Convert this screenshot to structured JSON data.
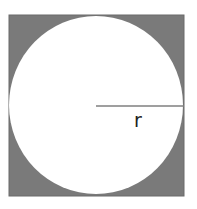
{
  "diagram": {
    "square": {
      "x": 9,
      "y": 15,
      "width": 175,
      "height": 181,
      "fill": "#7a7a7a",
      "stroke": "#6b6b6b"
    },
    "circle": {
      "cx": 96,
      "cy": 105,
      "rx": 87,
      "ry": 89,
      "fill": "#ffffff"
    },
    "radius_line": {
      "x1": 96,
      "y1": 106,
      "x2": 184,
      "y2": 106,
      "stroke": "#7f7f7f"
    },
    "radius_label": {
      "text": "r",
      "x": 134,
      "y": 127
    }
  }
}
